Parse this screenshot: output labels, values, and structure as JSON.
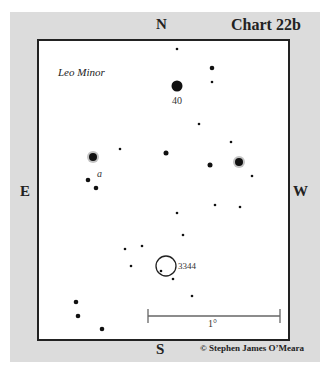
{
  "title": "Chart 22b",
  "constellation": "Leo Minor",
  "directions": {
    "north": "N",
    "south": "S",
    "east": "E",
    "west": "W"
  },
  "copyright": "© Stephen James O’Meara",
  "scale_bar": {
    "label": "1°",
    "x1": 148,
    "x2": 280,
    "y": 316
  },
  "objects": {
    "star_40": {
      "label": "40",
      "x": 177,
      "y": 86
    },
    "star_a": {
      "label": "a",
      "x": 99,
      "y": 174
    },
    "ngc_3344": {
      "label": "3344",
      "cx": 166,
      "cy": 266,
      "r": 10
    }
  },
  "stars": [
    {
      "x": 177,
      "y": 49,
      "r": 1.3
    },
    {
      "x": 212,
      "y": 68,
      "r": 2.3
    },
    {
      "x": 212,
      "y": 82,
      "r": 1.3
    },
    {
      "x": 177,
      "y": 86,
      "r": 5.5
    },
    {
      "x": 199,
      "y": 124,
      "r": 1.3
    },
    {
      "x": 231,
      "y": 142,
      "r": 1.3
    },
    {
      "x": 120,
      "y": 149,
      "r": 1.3
    },
    {
      "x": 166,
      "y": 153,
      "r": 2.5
    },
    {
      "x": 93,
      "y": 157,
      "r": 4,
      "halo": true
    },
    {
      "x": 239,
      "y": 162,
      "r": 4,
      "halo": true
    },
    {
      "x": 210,
      "y": 165,
      "r": 2.5
    },
    {
      "x": 252,
      "y": 176,
      "r": 1.3
    },
    {
      "x": 88,
      "y": 180,
      "r": 2.3
    },
    {
      "x": 96,
      "y": 188,
      "r": 2.3
    },
    {
      "x": 215,
      "y": 205,
      "r": 1.3
    },
    {
      "x": 240,
      "y": 207,
      "r": 1.3
    },
    {
      "x": 177,
      "y": 213,
      "r": 1.3
    },
    {
      "x": 183,
      "y": 235,
      "r": 1.3
    },
    {
      "x": 142,
      "y": 246,
      "r": 1.3
    },
    {
      "x": 125,
      "y": 249,
      "r": 1.3
    },
    {
      "x": 131,
      "y": 266,
      "r": 1.3
    },
    {
      "x": 161,
      "y": 271,
      "r": 1.3
    },
    {
      "x": 173,
      "y": 279,
      "r": 1.3
    },
    {
      "x": 192,
      "y": 296,
      "r": 1.3
    },
    {
      "x": 76,
      "y": 302,
      "r": 2.3
    },
    {
      "x": 78,
      "y": 316,
      "r": 2.3
    },
    {
      "x": 102,
      "y": 329,
      "r": 2.3
    }
  ]
}
